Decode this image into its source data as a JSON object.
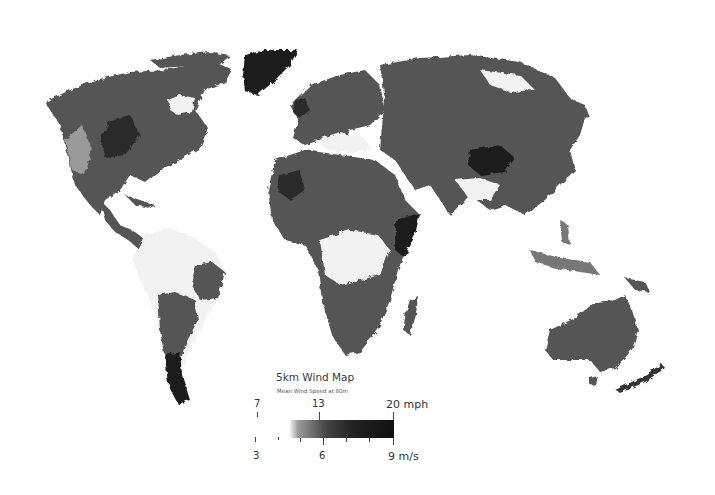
{
  "map": {
    "title": "5km Wind Map",
    "subtitle": "Mean Wind Speed at 80m",
    "projection": "world",
    "color_scale": "grayscale",
    "land_colors": {
      "low": "#f4f4f4",
      "mid": "#6e6e6e",
      "high": "#1e1e1e",
      "ocean": "#ffffff"
    }
  },
  "legend": {
    "mph_labels": {
      "min": "7",
      "mid": "13",
      "max": "20 mph"
    },
    "ms_labels": {
      "min": "3",
      "mid": "6",
      "max": "9 m/s"
    }
  },
  "regions": [
    {
      "name": "north-america"
    },
    {
      "name": "greenland"
    },
    {
      "name": "central-america"
    },
    {
      "name": "south-america"
    },
    {
      "name": "europe"
    },
    {
      "name": "africa"
    },
    {
      "name": "madagascar"
    },
    {
      "name": "asia"
    },
    {
      "name": "southeast-asia-islands"
    },
    {
      "name": "australia"
    },
    {
      "name": "new-zealand"
    },
    {
      "name": "tasmania"
    }
  ]
}
